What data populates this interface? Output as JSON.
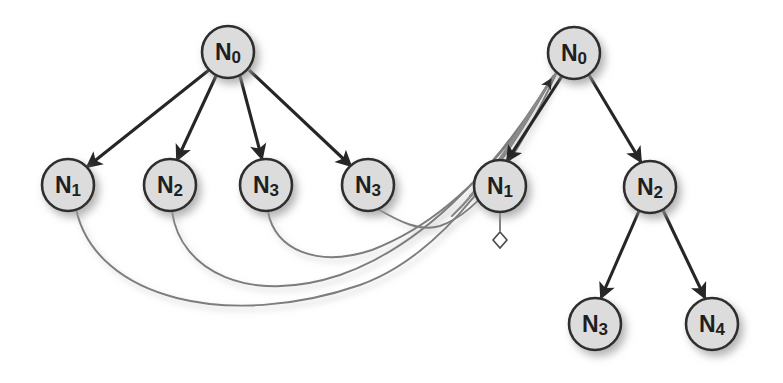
{
  "canvas": {
    "width": 783,
    "height": 383,
    "background": "#ffffff"
  },
  "style": {
    "node_fill": "#dcdcdc",
    "node_stroke": "#2e2e2e",
    "node_radius": 26,
    "label_color": "#1f1f1f",
    "tree_edge_color": "#262626",
    "curve_edge_color": "#7d7d7d",
    "bundle_edge_color": "#8a8a8a",
    "arrow_color": "#262626",
    "shadow_color": "#b4b4b4",
    "diamond_fill": "#ffffff",
    "diamond_stroke": "#4a4a4a"
  },
  "graphs": [
    {
      "id": "left-graph",
      "name": "left-tree",
      "nodes": [
        {
          "id": "L0",
          "base": "N",
          "sub": "0",
          "label": "N0",
          "cx": 228,
          "cy": 52,
          "r": 26
        },
        {
          "id": "L1",
          "base": "N",
          "sub": "1",
          "label": "N1",
          "cx": 68,
          "cy": 185,
          "r": 26
        },
        {
          "id": "L2",
          "base": "N",
          "sub": "2",
          "label": "N2",
          "cx": 170,
          "cy": 185,
          "r": 26
        },
        {
          "id": "L3",
          "base": "N",
          "sub": "3",
          "label": "N3",
          "cx": 266,
          "cy": 185,
          "r": 26
        },
        {
          "id": "L4",
          "base": "N",
          "sub": "3",
          "label": "N3",
          "cx": 368,
          "cy": 185,
          "r": 26
        }
      ],
      "edges": [
        {
          "id": "LE1",
          "from": "L0",
          "to": "L1",
          "kind": "arrow"
        },
        {
          "id": "LE2",
          "from": "L0",
          "to": "L2",
          "kind": "arrow"
        },
        {
          "id": "LE3",
          "from": "L0",
          "to": "L3",
          "kind": "arrow"
        },
        {
          "id": "LE4",
          "from": "L0",
          "to": "L4",
          "kind": "arrow"
        }
      ]
    },
    {
      "id": "right-graph",
      "name": "right-tree",
      "nodes": [
        {
          "id": "R0",
          "base": "N",
          "sub": "0",
          "label": "N0",
          "cx": 574,
          "cy": 53,
          "r": 26
        },
        {
          "id": "R1",
          "base": "N",
          "sub": "1",
          "label": "N1",
          "cx": 500,
          "cy": 186,
          "r": 26
        },
        {
          "id": "R2",
          "base": "N",
          "sub": "2",
          "label": "N2",
          "cx": 650,
          "cy": 187,
          "r": 26
        },
        {
          "id": "R3",
          "base": "N",
          "sub": "3",
          "label": "N3",
          "cx": 595,
          "cy": 324,
          "r": 26
        },
        {
          "id": "R4",
          "base": "N",
          "sub": "4",
          "label": "N4",
          "cx": 712,
          "cy": 324,
          "r": 26
        }
      ],
      "edges": [
        {
          "id": "RE1",
          "from": "R0",
          "to": "R1",
          "kind": "arrow"
        },
        {
          "id": "RE2",
          "from": "R0",
          "to": "R2",
          "kind": "arrow"
        },
        {
          "id": "RE3",
          "from": "R2",
          "to": "R3",
          "kind": "arrow"
        },
        {
          "id": "RE4",
          "from": "R2",
          "to": "R4",
          "kind": "arrow"
        }
      ],
      "markers": [
        {
          "id": "RM1",
          "kind": "diamond",
          "attached_to": "R1",
          "cx": 500,
          "cy": 240,
          "size": 8
        }
      ]
    }
  ],
  "cross_edges": [
    {
      "id": "CE1",
      "from": "L1",
      "to": "R0",
      "kind": "curve-arrow"
    },
    {
      "id": "CE2",
      "from": "L2",
      "to": "R0",
      "kind": "curve-arrow"
    },
    {
      "id": "CE3",
      "from": "L3",
      "to": "R0",
      "kind": "curve-arrow"
    },
    {
      "id": "CE4",
      "from": "L4",
      "to": "R0",
      "kind": "curve-arrow"
    }
  ],
  "diagram_data": {
    "type": "diagram",
    "title": "",
    "description": "Two node graphs; four curved mapping edges from the left tree leaves converge on the right tree root."
  }
}
